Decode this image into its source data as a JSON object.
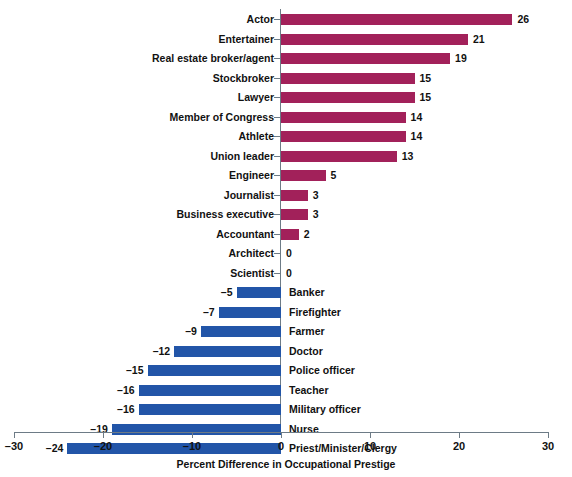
{
  "chart_data": {
    "type": "bar",
    "orientation": "horizontal",
    "title": "",
    "xlabel": "Percent Difference in Occupational Prestige",
    "ylabel": "",
    "xlim": [
      -30,
      30
    ],
    "xticks": [
      -30,
      -20,
      -10,
      0,
      10,
      20,
      30
    ],
    "xtick_labels": [
      "–30",
      "–20",
      "–10",
      "0",
      "10",
      "20",
      "30"
    ],
    "grid": false,
    "legend": false,
    "colors": {
      "positive": "#a2215a",
      "negative": "#2255a8",
      "axis": "#6d7b86",
      "text": "#111111",
      "background": "#ffffff"
    },
    "categories": [
      "Actor",
      "Entertainer",
      "Real estate broker/agent",
      "Stockbroker",
      "Lawyer",
      "Member of Congress",
      "Athlete",
      "Union leader",
      "Engineer",
      "Journalist",
      "Business executive",
      "Accountant",
      "Architect",
      "Scientist",
      "Banker",
      "Firefighter",
      "Farmer",
      "Doctor",
      "Police officer",
      "Teacher",
      "Military officer",
      "Nurse",
      "Priest/Minister/Clergy"
    ],
    "values": [
      26,
      21,
      19,
      15,
      15,
      14,
      14,
      13,
      5,
      3,
      3,
      2,
      0,
      0,
      -5,
      -7,
      -9,
      -12,
      -15,
      -16,
      -16,
      -19,
      -24
    ],
    "value_labels": [
      "26",
      "21",
      "19",
      "15",
      "15",
      "14",
      "14",
      "13",
      "5",
      "3",
      "3",
      "2",
      "0",
      "0",
      "–5",
      "–7",
      "–9",
      "–12",
      "–15",
      "–16",
      "–16",
      "–19",
      "–24"
    ]
  },
  "rows": [
    {
      "label": "Actor",
      "value": 26,
      "value_label": "26",
      "side": "positive"
    },
    {
      "label": "Entertainer",
      "value": 21,
      "value_label": "21",
      "side": "positive"
    },
    {
      "label": "Real estate broker/agent",
      "value": 19,
      "value_label": "19",
      "side": "positive"
    },
    {
      "label": "Stockbroker",
      "value": 15,
      "value_label": "15",
      "side": "positive"
    },
    {
      "label": "Lawyer",
      "value": 15,
      "value_label": "15",
      "side": "positive"
    },
    {
      "label": "Member of Congress",
      "value": 14,
      "value_label": "14",
      "side": "positive"
    },
    {
      "label": "Athlete",
      "value": 14,
      "value_label": "14",
      "side": "positive"
    },
    {
      "label": "Union leader",
      "value": 13,
      "value_label": "13",
      "side": "positive"
    },
    {
      "label": "Engineer",
      "value": 5,
      "value_label": "5",
      "side": "positive"
    },
    {
      "label": "Journalist",
      "value": 3,
      "value_label": "3",
      "side": "positive"
    },
    {
      "label": "Business executive",
      "value": 3,
      "value_label": "3",
      "side": "positive"
    },
    {
      "label": "Accountant",
      "value": 2,
      "value_label": "2",
      "side": "positive"
    },
    {
      "label": "Architect",
      "value": 0,
      "value_label": "0",
      "side": "zero"
    },
    {
      "label": "Scientist",
      "value": 0,
      "value_label": "0",
      "side": "zero"
    },
    {
      "label": "Banker",
      "value": -5,
      "value_label": "–5",
      "side": "negative"
    },
    {
      "label": "Firefighter",
      "value": -7,
      "value_label": "–7",
      "side": "negative"
    },
    {
      "label": "Farmer",
      "value": -9,
      "value_label": "–9",
      "side": "negative"
    },
    {
      "label": "Doctor",
      "value": -12,
      "value_label": "–12",
      "side": "negative"
    },
    {
      "label": "Police officer",
      "value": -15,
      "value_label": "–15",
      "side": "negative"
    },
    {
      "label": "Teacher",
      "value": -16,
      "value_label": "–16",
      "side": "negative"
    },
    {
      "label": "Military officer",
      "value": -16,
      "value_label": "–16",
      "side": "negative"
    },
    {
      "label": "Nurse",
      "value": -19,
      "value_label": "–19",
      "side": "negative"
    },
    {
      "label": "Priest/Minister/Clergy",
      "value": -24,
      "value_label": "–24",
      "side": "negative"
    }
  ],
  "axis": {
    "title": "Percent Difference in Occupational Prestige",
    "ticks": [
      {
        "value": -30,
        "label": "–30"
      },
      {
        "value": -20,
        "label": "–20"
      },
      {
        "value": -10,
        "label": "–10"
      },
      {
        "value": 0,
        "label": "0"
      },
      {
        "value": 10,
        "label": "10"
      },
      {
        "value": 20,
        "label": "20"
      },
      {
        "value": 30,
        "label": "30"
      }
    ]
  }
}
